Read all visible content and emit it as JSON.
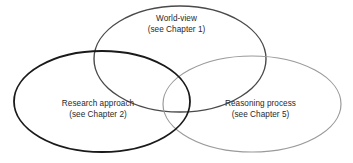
{
  "diagram": {
    "type": "venn-three-circle",
    "background_color": "#ffffff",
    "title": "",
    "sets": [
      {
        "id": "world-view",
        "title": "World-view",
        "subtitle": "(see Chapter 1)",
        "chapter": "1",
        "stroke_color": "#4a4a4a",
        "stroke_width": 1.4,
        "cx": 180,
        "cy": 59,
        "rx": 86,
        "ry": 53,
        "rotation": 0
      },
      {
        "id": "research-approach",
        "title": "Research approach",
        "subtitle": "(see Chapter 2)",
        "chapter": "2",
        "stroke_color": "#1a1a1a",
        "stroke_width": 1.8,
        "cx": 102,
        "cy": 101.5,
        "rx": 88,
        "ry": 50.5,
        "rotation": 0
      },
      {
        "id": "reasoning-process",
        "title": "Reasoning process",
        "subtitle": "(see Chapter 5)",
        "chapter": "5",
        "stroke_color": "#9a9a9a",
        "stroke_width": 1.2,
        "cx": 252,
        "cy": 104,
        "rx": 89,
        "ry": 48,
        "rotation": 0
      }
    ],
    "text_color": "#27292b"
  }
}
